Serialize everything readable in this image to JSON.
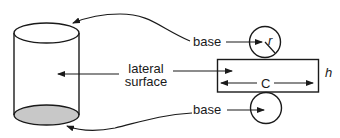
{
  "diagram": {
    "labels": {
      "top_base": "base",
      "bottom_base": "base",
      "lateral_line1": "lateral",
      "lateral_line2": "surface",
      "radius": "r",
      "circumference": "C",
      "height": "h"
    },
    "colors": {
      "stroke": "#1a1a1a",
      "shaded_base": "#c8c8c8",
      "background": "#ffffff"
    },
    "parts": [
      {
        "name": "cylinder",
        "description": "3D cylinder with shaded bottom base"
      },
      {
        "name": "top-base-circle",
        "description": "circle net with radius r"
      },
      {
        "name": "lateral-rectangle",
        "description": "rectangle with width C and height h"
      },
      {
        "name": "bottom-base-circle",
        "description": "circle net"
      }
    ]
  }
}
